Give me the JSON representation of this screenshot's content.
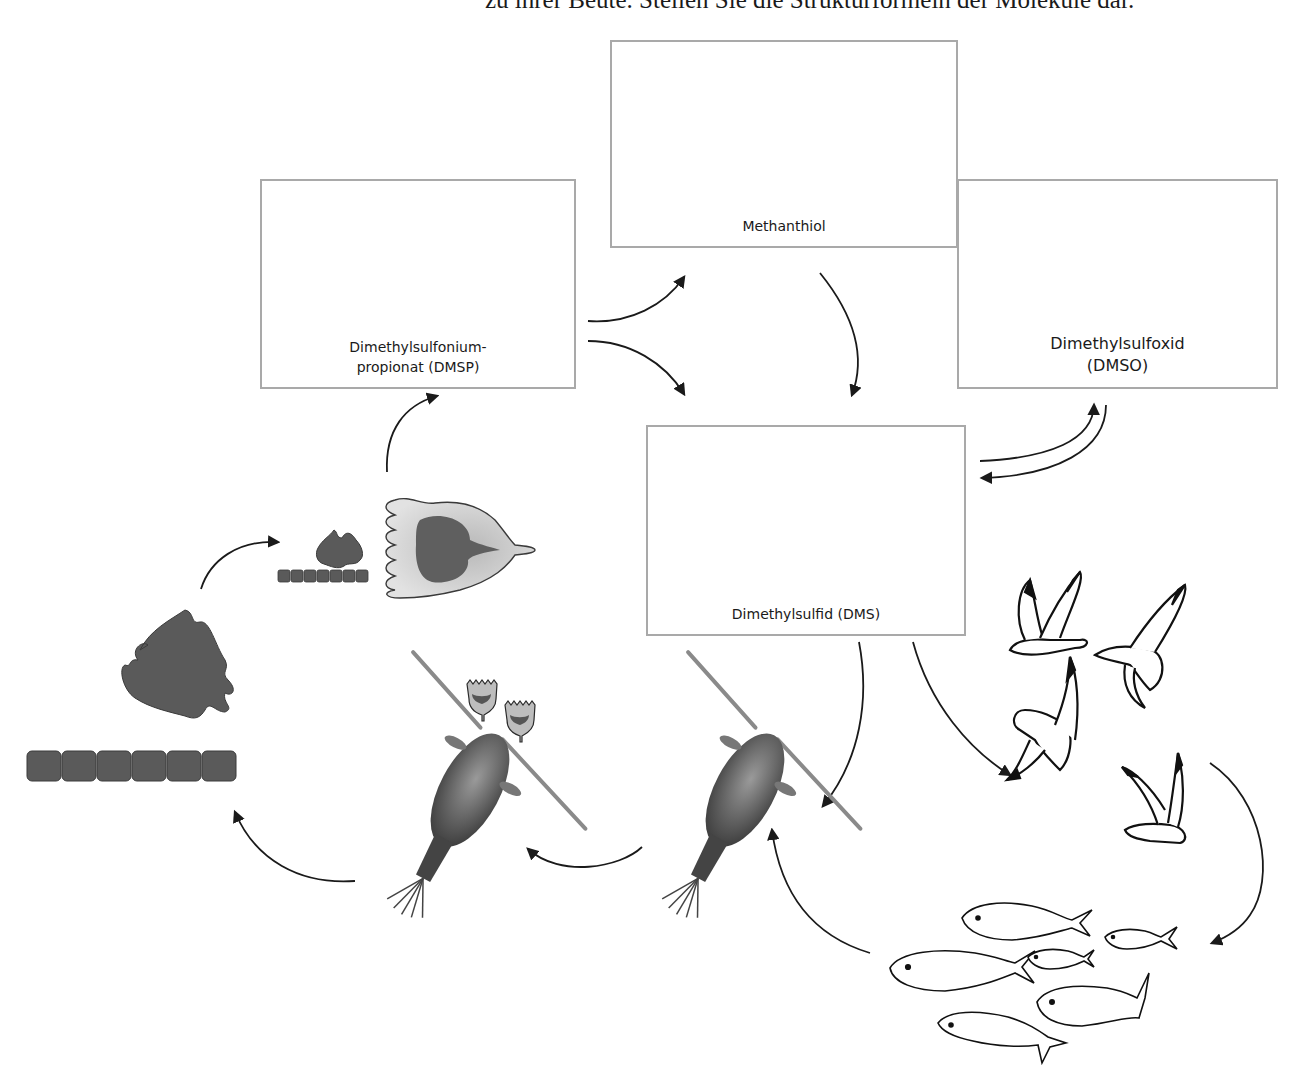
{
  "instruction": "zu ihrer Beute. Stellen Sie die Strukturformeln der Moleküle dar.",
  "boxes": {
    "dmsp": {
      "line1": "Dimethylsulfonium-",
      "line2": "propionat (DMSP)"
    },
    "methanthiol": {
      "line1": "Methanthiol"
    },
    "dmso": {
      "line1": "Dimethylsulfoxid",
      "line2": "(DMSO)"
    },
    "dms": {
      "line1": "Dimethylsulfid (DMS)"
    }
  },
  "organisms": {
    "phytoplankton": "phytoplankton",
    "dinoflagellate": "heterotrophic dinoflagellate",
    "ciliates": "tintinnid ciliates",
    "copepod_1": "copepod",
    "copepod_2": "copepod",
    "seabirds": "seabirds",
    "fish": "fish school"
  },
  "colors": {
    "box_border": "#a9a9a9",
    "cell_fill": "#5a5a5a",
    "arrow": "#1a1a1a"
  }
}
